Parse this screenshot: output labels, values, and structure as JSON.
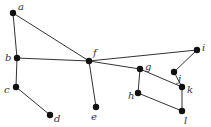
{
  "graph": {
    "nodes": [
      {
        "id": "a",
        "label": "a",
        "x": 13,
        "y": 13,
        "lx": 18,
        "ly": 10
      },
      {
        "id": "b",
        "label": "b",
        "x": 17,
        "y": 58,
        "lx": 5,
        "ly": 61
      },
      {
        "id": "c",
        "label": "c",
        "x": 16,
        "y": 87,
        "lx": 4,
        "ly": 93
      },
      {
        "id": "d",
        "label": "d",
        "x": 50,
        "y": 115,
        "lx": 54,
        "ly": 122
      },
      {
        "id": "e",
        "label": "e",
        "x": 96,
        "y": 107,
        "lx": 91,
        "ly": 120
      },
      {
        "id": "f",
        "label": "f",
        "x": 89,
        "y": 61,
        "lx": 93,
        "ly": 56
      },
      {
        "id": "g",
        "label": "g",
        "x": 140,
        "y": 69,
        "lx": 145,
        "ly": 70
      },
      {
        "id": "h",
        "label": "h",
        "x": 138,
        "y": 93,
        "lx": 128,
        "ly": 99
      },
      {
        "id": "i",
        "label": "i",
        "x": 197,
        "y": 50,
        "lx": 202,
        "ly": 51
      },
      {
        "id": "j",
        "label": "j",
        "x": 174,
        "y": 72,
        "lx": 178,
        "ly": 82
      },
      {
        "id": "k",
        "label": "k",
        "x": 182,
        "y": 87,
        "lx": 187,
        "ly": 93
      },
      {
        "id": "l",
        "label": "l",
        "x": 182,
        "y": 111,
        "lx": 184,
        "ly": 124
      }
    ],
    "edges": [
      [
        "a",
        "b"
      ],
      [
        "a",
        "f"
      ],
      [
        "b",
        "f"
      ],
      [
        "b",
        "c"
      ],
      [
        "c",
        "d"
      ],
      [
        "f",
        "e"
      ],
      [
        "f",
        "g"
      ],
      [
        "f",
        "i"
      ],
      [
        "g",
        "h"
      ],
      [
        "g",
        "k"
      ],
      [
        "h",
        "l"
      ],
      [
        "l",
        "k"
      ],
      [
        "k",
        "j"
      ],
      [
        "j",
        "i"
      ]
    ]
  }
}
